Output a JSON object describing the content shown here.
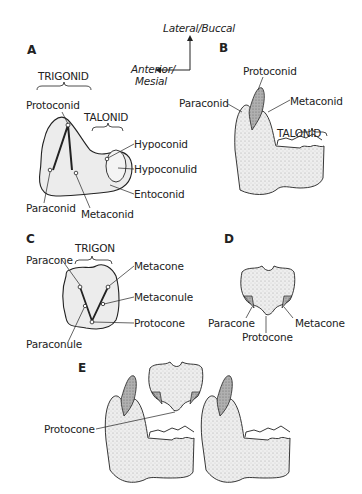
{
  "orientation": {
    "lateral": "Lateral/Buccal",
    "anterior_line1": "Anterior/",
    "anterior_line2": "Mesial"
  },
  "panels": {
    "A": {
      "letter": "A",
      "groups": [
        "TRIGONID",
        "TALONID"
      ],
      "cusps": [
        "Protoconid",
        "Hypoconid",
        "Hypoconulid",
        "Entoconid",
        "Paraconid",
        "Metaconid"
      ]
    },
    "B": {
      "letter": "B",
      "groups": [
        "TALONID"
      ],
      "cusps": [
        "Protoconid",
        "Paraconid",
        "Metaconid"
      ]
    },
    "C": {
      "letter": "C",
      "groups": [
        "TRIGON"
      ],
      "cusps": [
        "Paracone",
        "Metacone",
        "Metaconule",
        "Protocone",
        "Paraconule"
      ]
    },
    "D": {
      "letter": "D",
      "cusps": [
        "Paracone",
        "Protocone",
        "Metacone"
      ]
    },
    "E": {
      "letter": "E",
      "cusps": [
        "Protocone"
      ]
    }
  },
  "colors": {
    "ink": "#222222",
    "tooth_fill": "#ececec",
    "tooth_shade": "#9a9a9a",
    "cusp_dark": "#8a8a8a"
  }
}
